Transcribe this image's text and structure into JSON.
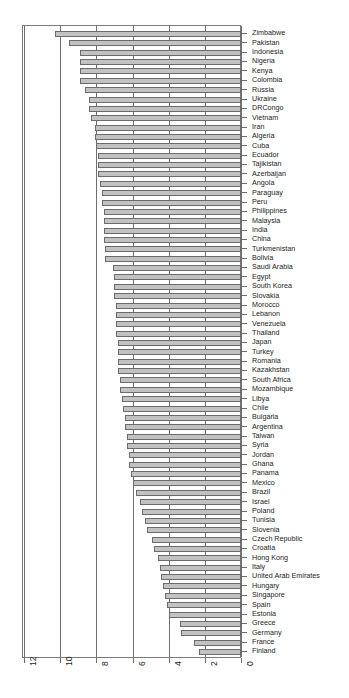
{
  "chart_data": {
    "type": "bar",
    "orientation": "horizontal",
    "title": "",
    "subtitle": "",
    "xlabel": "",
    "ylabel": "",
    "xlim": [
      12,
      0
    ],
    "x_axis_reversed": true,
    "xticks": [
      12,
      10,
      8,
      6,
      4,
      2,
      0
    ],
    "xtick_labels": [
      "12",
      "10",
      "8",
      "6",
      "4",
      "2",
      "0"
    ],
    "grid": true,
    "gridlines_x": [
      12,
      10,
      8,
      6,
      4,
      2,
      0
    ],
    "legend": null,
    "bar_color": "#c2c2c2",
    "bar_border_color": "#6b6b6b",
    "axis_color": "#6e6e6e",
    "categories": [
      "Zimbabwe",
      "Pakistan",
      "Indonesia",
      "Nigeria",
      "Kenya",
      "Colombia",
      "Russia",
      "Ukraine",
      "DRCongo",
      "Vietnam",
      "Iran",
      "Algeria",
      "Cuba",
      "Ecuador",
      "Tajikistan",
      "Azerbaijan",
      "Angola",
      "Paraguay",
      "Peru",
      "Philippines",
      "Malaysia",
      "India",
      "China",
      "Turkmenistan",
      "Bolivia",
      "Saudi Arabia",
      "Egypt",
      "South Korea",
      "Slovakia",
      "Morocco",
      "Lebanon",
      "Venezuela",
      "Thailand",
      "Japan",
      "Turkey",
      "Romania",
      "Kazakhstan",
      "South Africa",
      "Mozambique",
      "Libya",
      "Chile",
      "Bulgaria",
      "Argentina",
      "Taiwan",
      "Syria",
      "Jordan",
      "Ghana",
      "Panama",
      "Mexico",
      "Brazil",
      "Israel",
      "Poland",
      "Tunisia",
      "Slovenia",
      "Czech Republic",
      "Croatia",
      "Hong Kong",
      "Italy",
      "United Arab Emirates",
      "Hungary",
      "Singapore",
      "Spain",
      "Estonia",
      "Greece",
      "Germany",
      "France",
      "Finland"
    ],
    "values": [
      10.3,
      9.5,
      8.9,
      8.9,
      8.9,
      8.9,
      8.6,
      8.4,
      8.4,
      8.3,
      8.1,
      8.1,
      8.0,
      7.9,
      7.9,
      7.9,
      7.8,
      7.7,
      7.7,
      7.6,
      7.6,
      7.6,
      7.6,
      7.5,
      7.5,
      7.1,
      7.0,
      7.0,
      7.0,
      6.9,
      6.9,
      6.9,
      6.9,
      6.8,
      6.8,
      6.8,
      6.8,
      6.7,
      6.7,
      6.6,
      6.5,
      6.4,
      6.4,
      6.3,
      6.3,
      6.2,
      6.2,
      6.1,
      6.0,
      5.8,
      5.6,
      5.5,
      5.3,
      5.2,
      4.9,
      4.8,
      4.6,
      4.5,
      4.4,
      4.3,
      4.2,
      4.1,
      4.0,
      3.4,
      3.3,
      2.6,
      2.3
    ]
  }
}
